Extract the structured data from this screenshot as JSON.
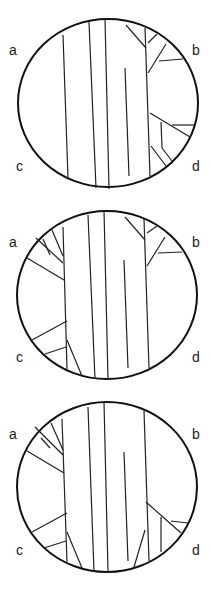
{
  "panels": [
    {
      "id": "panel-1",
      "labels": {
        "a": "a",
        "b": "b",
        "c": "c",
        "d": "d"
      },
      "circle": {
        "cx": 108,
        "cy": 103,
        "rx": 90,
        "ry": 84
      },
      "lines": [
        [
          63,
          35,
          68,
          178
        ],
        [
          89,
          22,
          96,
          188
        ],
        [
          105,
          19,
          109,
          189
        ],
        [
          125,
          68,
          129,
          176
        ],
        [
          145,
          28,
          150,
          176
        ],
        [
          126,
          25,
          146,
          48
        ],
        [
          148,
          43,
          157,
          34
        ],
        [
          148,
          73,
          166,
          44
        ],
        [
          159,
          61,
          183,
          59
        ],
        [
          150,
          113,
          190,
          137
        ],
        [
          161,
          122,
          162,
          148
        ],
        [
          162,
          148,
          172,
          161
        ],
        [
          172,
          125,
          194,
          125
        ],
        [
          151,
          146,
          166,
          166
        ]
      ]
    },
    {
      "id": "panel-2",
      "labels": {
        "a": "a",
        "b": "b",
        "c": "c",
        "d": "d"
      },
      "circle": {
        "cx": 107,
        "cy": 295,
        "rx": 90,
        "ry": 84
      },
      "lines": [
        [
          63,
          227,
          67,
          369
        ],
        [
          88,
          215,
          95,
          379
        ],
        [
          104,
          210,
          108,
          379
        ],
        [
          124,
          260,
          128,
          368
        ],
        [
          144,
          219,
          149,
          368
        ],
        [
          125,
          217,
          145,
          240
        ],
        [
          147,
          233,
          157,
          226
        ],
        [
          147,
          266,
          165,
          237
        ],
        [
          158,
          253,
          182,
          252
        ],
        [
          36,
          238,
          63,
          263
        ],
        [
          43,
          239,
          50,
          255
        ],
        [
          52,
          230,
          63,
          256
        ],
        [
          27,
          258,
          64,
          280
        ],
        [
          32,
          340,
          67,
          321
        ],
        [
          45,
          354,
          66,
          347
        ],
        [
          67,
          340,
          82,
          376
        ]
      ]
    },
    {
      "id": "panel-3",
      "labels": {
        "a": "a",
        "b": "b",
        "c": "c",
        "d": "d"
      },
      "circle": {
        "cx": 107,
        "cy": 487,
        "rx": 90,
        "ry": 85
      },
      "lines": [
        [
          62,
          419,
          67,
          562
        ],
        [
          88,
          407,
          94,
          572
        ],
        [
          104,
          402,
          108,
          572
        ],
        [
          124,
          452,
          128,
          561
        ],
        [
          144,
          411,
          149,
          561
        ],
        [
          35,
          427,
          63,
          455
        ],
        [
          41,
          438,
          50,
          448
        ],
        [
          51,
          423,
          63,
          450
        ],
        [
          27,
          451,
          64,
          473
        ],
        [
          32,
          532,
          67,
          513
        ],
        [
          44,
          548,
          66,
          541
        ],
        [
          67,
          532,
          82,
          568
        ],
        [
          146,
          502,
          181,
          533
        ],
        [
          161,
          517,
          161,
          552
        ],
        [
          171,
          521,
          188,
          523
        ],
        [
          145,
          530,
          134,
          567
        ]
      ]
    }
  ]
}
